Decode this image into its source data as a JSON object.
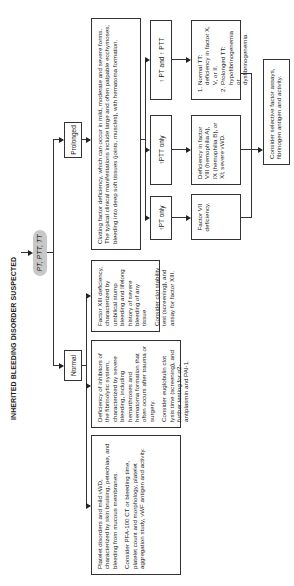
{
  "title": "INHERITED BLEEDING DISORDER SUSPECTED",
  "start_test": "PT, PTT, TT",
  "branches": {
    "normal": "Normal",
    "prolonged": "Prolonged"
  },
  "normal_boxes": [
    {
      "desc": "Platelet disorders and mild vWD, characterized by skin bruising, petechiae, and bleeding from mucous membranes.",
      "action": "Consider PFA-100 CT or bleeding time, platelet count and morphology, platelet aggregation study, vWF antigen and activity."
    },
    {
      "desc": "Deficiency of inhibitors of the fibrinolytic system, characterized by severe bleeding, including hemarthroses and hematoma formation that often occurs after trauma or surgery.",
      "action": "Consider euglobulin clot lysis time (screening), and further testing for α2-antiplasmin and PAI-1."
    },
    {
      "desc": "Factor XIII deficiency, characterized by umbilical stump bleeding and lifelong history of severe bleeding of any tissue.",
      "action": "Consider clot stability test (screening), and assay for factor XIII."
    }
  ],
  "prolonged_box": "Clotting factor deficiency, which can occur in mild, moderate and severe forms. The typical clinical manifestations include large and often palpable ecchymoses, bleeding into deep soft tissues (joints, muscles), with hematoma formation.",
  "sub_tests": [
    {
      "label": "↑PT only",
      "result": "Factor VII deficiency."
    },
    {
      "label": "↑PTT only",
      "result": "Deficiency in factor VIII (hemophilia A), IX (hemophilia B), or XI; severe vWD."
    },
    {
      "label": "↑ PT and ↑ PTT",
      "result_list": [
        "Normal TT: deficiency in factor X, V, or II.",
        "Prolonged TT: hypofibrinogenemia or dysfibrinogenemia."
      ]
    }
  ],
  "final": "Consider selective factor assays, fibrinogen antigen and activity."
}
